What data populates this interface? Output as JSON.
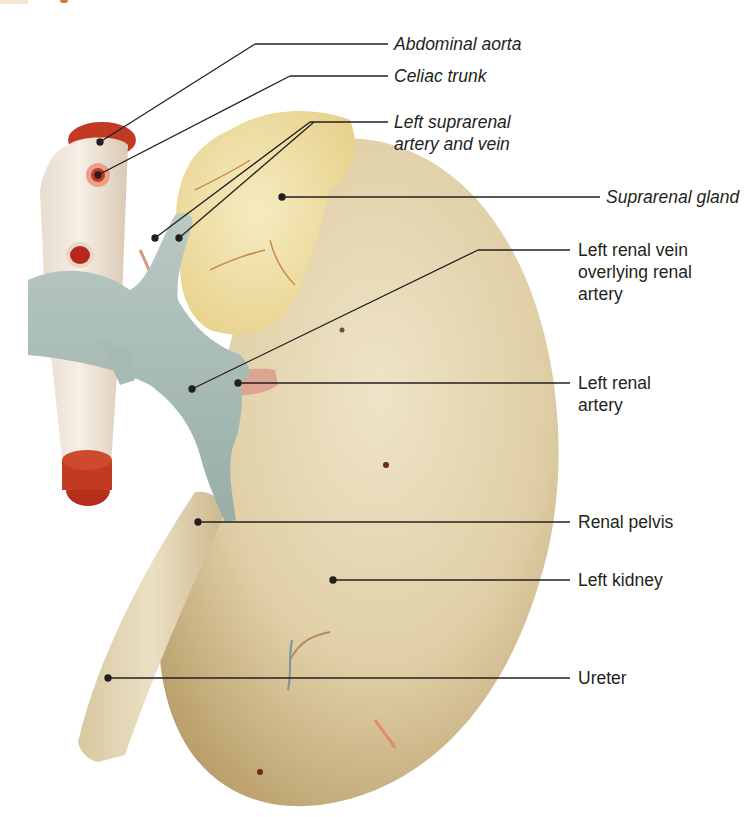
{
  "figure": {
    "colors": {
      "background": "#ffffff",
      "kidney": "#e3d3ad",
      "kidney_shadow": "#b89d66",
      "suprarenal_gland": "#eedd9a",
      "aorta": "#efe4d6",
      "aorta_lumen": "#c4341f",
      "renal_vein": "#a9bcb6",
      "renal_artery": "#d9a08e",
      "ureter": "#ddd0ab",
      "leader_line": "#231f20",
      "label_text": "#231f20"
    },
    "labels": [
      {
        "id": "abdominal-aorta",
        "text": "Abdominal aorta",
        "italic": true
      },
      {
        "id": "celiac-trunk",
        "text": "Celiac trunk",
        "italic": true
      },
      {
        "id": "left-suprarenal-artery-vein",
        "text": "Left suprarenal\nartery and vein",
        "italic": true
      },
      {
        "id": "suprarenal-gland",
        "text": "Suprarenal gland",
        "italic": true
      },
      {
        "id": "left-renal-vein",
        "text": "Left renal vein\noverlying renal\nartery",
        "italic": false
      },
      {
        "id": "left-renal-artery",
        "text": "Left renal\nartery",
        "italic": false
      },
      {
        "id": "renal-pelvis",
        "text": "Renal pelvis",
        "italic": false
      },
      {
        "id": "left-kidney",
        "text": "Left kidney",
        "italic": false
      },
      {
        "id": "ureter",
        "text": "Ureter",
        "italic": false
      }
    ]
  }
}
